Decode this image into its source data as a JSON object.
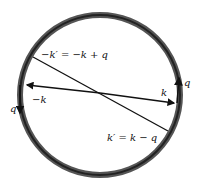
{
  "diagram": {
    "type": "fermi-sphere-scattering",
    "labels": {
      "k_prime_neg": "−k′ = −k + q",
      "k_neg": "−k",
      "k": "k",
      "k_prime": "k′ = k − q",
      "q_left": "q",
      "q_right": "q"
    },
    "colors": {
      "ring": "#3a3a3a",
      "line": "#111111",
      "background": "#ffffff"
    }
  }
}
